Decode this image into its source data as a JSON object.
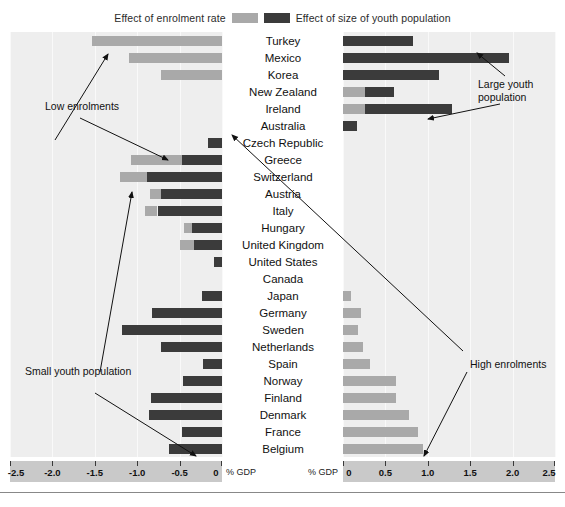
{
  "legend": {
    "left_label": "Effect of enrolment rate",
    "right_label": "Effect of size of youth population",
    "light_color": "#a9a9a9",
    "dark_color": "#3b3b3b"
  },
  "axes": {
    "left": {
      "unit_label": "% GDP",
      "ticks": [
        "-2.5",
        "-2.0",
        "-1.5",
        "-1.0",
        "-0.5",
        "0"
      ],
      "min": -2.5,
      "max": 0
    },
    "right": {
      "unit_label": "% GDP",
      "ticks": [
        "0",
        "0.5",
        "1.0",
        "1.5",
        "2.0",
        "2.5"
      ],
      "min": 0,
      "max": 2.5
    }
  },
  "annotations": {
    "low_enrolments": "Low enrolments",
    "small_youth_population": "Small youth population",
    "large_youth_population": "Large youth\npopulation",
    "high_enrolments": "High enrolments"
  },
  "chart_data": {
    "type": "bar",
    "title": "",
    "subtitle": "",
    "xlabel": "% GDP",
    "ylabel": "",
    "orientation": "horizontal",
    "layout": "diverging-two-panel-stacked",
    "legend_position": "top-center",
    "grid": true,
    "series": [
      {
        "name": "Effect of enrolment rate",
        "color": "#a9a9a9"
      },
      {
        "name": "Effect of size of youth population",
        "color": "#3b3b3b"
      }
    ],
    "categories": [
      "Turkey",
      "Mexico",
      "Korea",
      "New Zealand",
      "Ireland",
      "Australia",
      "Czech Republic",
      "Greece",
      "Switzerland",
      "Austria",
      "Italy",
      "Hungary",
      "United Kingdom",
      "United States",
      "Canada",
      "Japan",
      "Germany",
      "Sweden",
      "Netherlands",
      "Spain",
      "Norway",
      "Finland",
      "Denmark",
      "France",
      "Belgium"
    ],
    "left_panel": {
      "xlabel": "% GDP",
      "xlim": [
        -2.5,
        0
      ],
      "rows": [
        {
          "country": "Turkey",
          "enrolment": -1.53,
          "youth": 0.0
        },
        {
          "country": "Mexico",
          "enrolment": -1.1,
          "youth": 0.0
        },
        {
          "country": "Korea",
          "enrolment": -0.72,
          "youth": 0.0
        },
        {
          "country": "New Zealand",
          "enrolment": 0.0,
          "youth": 0.0
        },
        {
          "country": "Ireland",
          "enrolment": 0.0,
          "youth": 0.0
        },
        {
          "country": "Australia",
          "enrolment": 0.0,
          "youth": 0.0
        },
        {
          "country": "Czech Republic",
          "enrolment": 0.0,
          "youth": -0.17
        },
        {
          "country": "Greece",
          "enrolment": -0.6,
          "youth": -0.47
        },
        {
          "country": "Switzerland",
          "enrolment": -0.32,
          "youth": -0.88
        },
        {
          "country": "Austria",
          "enrolment": -0.13,
          "youth": -0.72
        },
        {
          "country": "Italy",
          "enrolment": -0.15,
          "youth": -0.76
        },
        {
          "country": "Hungary",
          "enrolment": -0.1,
          "youth": -0.35
        },
        {
          "country": "United Kingdom",
          "enrolment": -0.16,
          "youth": -0.33
        },
        {
          "country": "United States",
          "enrolment": 0.0,
          "youth": -0.09
        },
        {
          "country": "Canada",
          "enrolment": 0.0,
          "youth": 0.0
        },
        {
          "country": "Japan",
          "enrolment": 0.0,
          "youth": -0.24
        },
        {
          "country": "Germany",
          "enrolment": 0.0,
          "youth": -0.83
        },
        {
          "country": "Sweden",
          "enrolment": 0.0,
          "youth": -1.18
        },
        {
          "country": "Netherlands",
          "enrolment": 0.0,
          "youth": -0.72
        },
        {
          "country": "Spain",
          "enrolment": 0.0,
          "youth": -0.23
        },
        {
          "country": "Norway",
          "enrolment": 0.0,
          "youth": -0.46
        },
        {
          "country": "Finland",
          "enrolment": 0.0,
          "youth": -0.84
        },
        {
          "country": "Denmark",
          "enrolment": 0.0,
          "youth": -0.86
        },
        {
          "country": "France",
          "enrolment": 0.0,
          "youth": -0.47
        },
        {
          "country": "Belgium",
          "enrolment": 0.0,
          "youth": -0.62
        }
      ]
    },
    "right_panel": {
      "xlabel": "% GDP",
      "xlim": [
        0,
        2.5
      ],
      "rows": [
        {
          "country": "Turkey",
          "enrolment": 0.0,
          "youth": 0.83
        },
        {
          "country": "Mexico",
          "enrolment": 0.0,
          "youth": 1.96
        },
        {
          "country": "Korea",
          "enrolment": 0.0,
          "youth": 1.13
        },
        {
          "country": "New Zealand",
          "enrolment": 0.26,
          "youth": 0.34
        },
        {
          "country": "Ireland",
          "enrolment": 0.26,
          "youth": 1.03
        },
        {
          "country": "Australia",
          "enrolment": 0.0,
          "youth": 0.17
        },
        {
          "country": "Czech Republic",
          "enrolment": 0.0,
          "youth": 0.0
        },
        {
          "country": "Greece",
          "enrolment": 0.0,
          "youth": 0.0
        },
        {
          "country": "Switzerland",
          "enrolment": 0.0,
          "youth": 0.0
        },
        {
          "country": "Austria",
          "enrolment": 0.0,
          "youth": 0.0
        },
        {
          "country": "Italy",
          "enrolment": 0.0,
          "youth": 0.0
        },
        {
          "country": "Hungary",
          "enrolment": 0.0,
          "youth": 0.0
        },
        {
          "country": "United Kingdom",
          "enrolment": 0.0,
          "youth": 0.0
        },
        {
          "country": "United States",
          "enrolment": 0.0,
          "youth": 0.0
        },
        {
          "country": "Canada",
          "enrolment": 0.0,
          "youth": 0.0
        },
        {
          "country": "Japan",
          "enrolment": 0.09,
          "youth": 0.0
        },
        {
          "country": "Germany",
          "enrolment": 0.21,
          "youth": 0.0
        },
        {
          "country": "Sweden",
          "enrolment": 0.18,
          "youth": 0.0
        },
        {
          "country": "Netherlands",
          "enrolment": 0.23,
          "youth": 0.0
        },
        {
          "country": "Spain",
          "enrolment": 0.32,
          "youth": 0.0
        },
        {
          "country": "Norway",
          "enrolment": 0.62,
          "youth": 0.0
        },
        {
          "country": "Finland",
          "enrolment": 0.62,
          "youth": 0.0
        },
        {
          "country": "Denmark",
          "enrolment": 0.78,
          "youth": 0.0
        },
        {
          "country": "France",
          "enrolment": 0.88,
          "youth": 0.0
        },
        {
          "country": "Belgium",
          "enrolment": 0.94,
          "youth": 0.0
        }
      ]
    }
  }
}
